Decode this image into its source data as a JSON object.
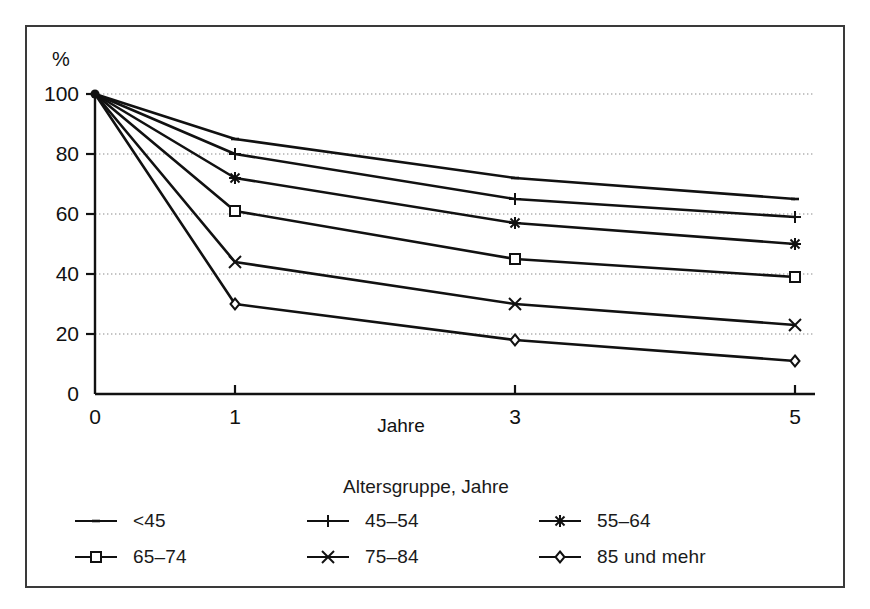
{
  "chart_data": {
    "type": "line",
    "title": "",
    "xlabel": "Jahre",
    "ylabel": "%",
    "y_unit_label": "%",
    "x": [
      0,
      1,
      3,
      5
    ],
    "x_tick_labels": [
      "0",
      "1",
      "3",
      "5"
    ],
    "y_tick_labels": [
      "0",
      "20",
      "40",
      "60",
      "80",
      "100"
    ],
    "y_ticks": [
      0,
      20,
      40,
      60,
      80,
      100
    ],
    "xlim": [
      0,
      5
    ],
    "ylim": [
      0,
      100
    ],
    "grid": true,
    "grid_style": "dotted-horizontal",
    "legend_position": "below",
    "legend_title": "Altersgruppe, Jahre",
    "series": [
      {
        "name": "<45",
        "marker": "dash",
        "values": [
          100,
          85,
          72,
          65
        ]
      },
      {
        "name": "45–54",
        "marker": "plus",
        "values": [
          100,
          80,
          65,
          59
        ]
      },
      {
        "name": "55–64",
        "marker": "asterisk",
        "values": [
          100,
          72,
          57,
          50
        ]
      },
      {
        "name": "65–74",
        "marker": "square",
        "values": [
          100,
          61,
          45,
          39
        ]
      },
      {
        "name": "75–84",
        "marker": "cross",
        "values": [
          100,
          44,
          30,
          23
        ]
      },
      {
        "name": "85 und mehr",
        "marker": "diamond",
        "values": [
          100,
          30,
          18,
          11
        ]
      }
    ]
  },
  "legend": {
    "title": "Altersgruppe, Jahre",
    "items": [
      {
        "label": "<45",
        "marker": "dash"
      },
      {
        "label": "45–54",
        "marker": "plus"
      },
      {
        "label": "55–64",
        "marker": "asterisk"
      },
      {
        "label": "65–74",
        "marker": "square"
      },
      {
        "label": "75–84",
        "marker": "cross"
      },
      {
        "label": "85 und mehr",
        "marker": "diamond"
      }
    ]
  },
  "axes": {
    "y_unit": "%",
    "x_title": "Jahre"
  },
  "colors": {
    "line": "#111111",
    "grid": "#8a8a8a",
    "frame": "#3a3a3a",
    "background": "#ffffff"
  }
}
